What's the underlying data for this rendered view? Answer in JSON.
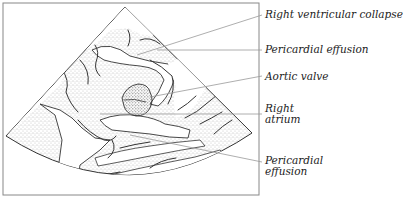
{
  "figure": {
    "type": "echocardiogram-line-drawing",
    "frame_color": "#888888",
    "line_color": "#333333",
    "stipple_color": "#777777",
    "leader_color": "#999999"
  },
  "labels": [
    {
      "id": "rv-collapse",
      "text": "Right ventricular collapse",
      "lines": [
        "Right ventricular collapse"
      ]
    },
    {
      "id": "pericardial-effusion-top",
      "text": "Pericardial effusion",
      "lines": [
        "Pericardial effusion"
      ]
    },
    {
      "id": "aortic-valve",
      "text": "Aortic valve",
      "lines": [
        "Aortic valve"
      ]
    },
    {
      "id": "right-atrium",
      "text": "Right atrium",
      "lines": [
        "Right",
        "atrium"
      ]
    },
    {
      "id": "pericardial-effusion-bottom",
      "text": "Pericardial effusion",
      "lines": [
        "Pericardial",
        "effusion"
      ]
    }
  ]
}
